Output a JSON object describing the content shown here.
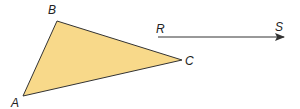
{
  "diagram": {
    "triangle": {
      "fill": "#f8d98a",
      "stroke": "#333333",
      "vertices": {
        "A": {
          "label": "A",
          "x": 23,
          "y": 96
        },
        "B": {
          "label": "B",
          "x": 57,
          "y": 21
        },
        "C": {
          "label": "C",
          "x": 182,
          "y": 60
        }
      }
    },
    "ray": {
      "start_label": "R",
      "end_label": "S",
      "x1": 158,
      "y1": 37,
      "x2": 284,
      "y2": 37,
      "stroke": "#333333"
    }
  }
}
